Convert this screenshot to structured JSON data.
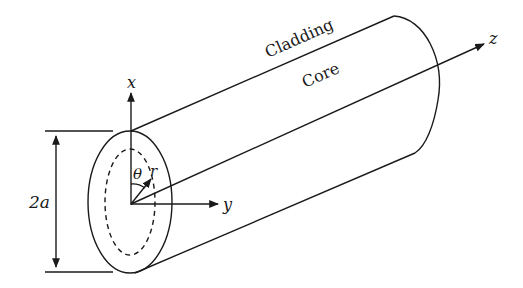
{
  "diagram": {
    "type": "optical-fiber-cylindrical-coordinates",
    "labels": {
      "cladding": "Cladding",
      "core": "Core",
      "axis_x": "x",
      "axis_y": "y",
      "axis_z": "z",
      "angle": "θ",
      "radius": "r",
      "diameter": "2a"
    },
    "colors": {
      "stroke": "#1a1a1a",
      "background": "#ffffff"
    }
  }
}
